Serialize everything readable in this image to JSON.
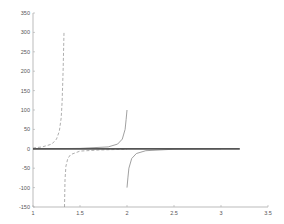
{
  "chart_data": {
    "type": "line",
    "title": "",
    "xlabel": "",
    "ylabel": "",
    "xlim": [
      1,
      3.5
    ],
    "ylim": [
      -150,
      350
    ],
    "grid": false,
    "legend": null,
    "x_ticks": [
      "1",
      "1.5",
      "2",
      "2.5",
      "3",
      "3.5"
    ],
    "y_ticks": [
      "350",
      "300",
      "250",
      "200",
      "150",
      "100",
      "50",
      "0",
      "-50",
      "-100",
      "-150"
    ],
    "series": [
      {
        "name": "dashed-curve",
        "style": "dashed",
        "color": "#999999",
        "segments": [
          {
            "x": [
              1.0,
              1.1,
              1.2,
              1.25,
              1.28,
              1.3,
              1.31,
              1.32,
              1.33
            ],
            "y": [
              2,
              5,
              12,
              25,
              45,
              80,
              120,
              200,
              300
            ]
          },
          {
            "x": [
              1.335,
              1.34,
              1.35,
              1.37,
              1.4,
              1.5,
              1.7,
              2.0
            ],
            "y": [
              -150,
              -80,
              -45,
              -25,
              -15,
              -6,
              -3,
              -1
            ]
          }
        ]
      },
      {
        "name": "solid-curve",
        "style": "solid",
        "color": "#888888",
        "segments": [
          {
            "x": [
              1.0,
              1.5,
              1.8,
              1.9,
              1.95,
              1.98,
              1.99,
              2.0
            ],
            "y": [
              0,
              1,
              5,
              12,
              25,
              50,
              75,
              100
            ]
          },
          {
            "x": [
              2.0,
              2.01,
              2.02,
              2.05,
              2.1,
              2.2,
              2.5,
              3.0
            ],
            "y": [
              -100,
              -75,
              -50,
              -25,
              -12,
              -5,
              -1,
              0
            ]
          }
        ]
      },
      {
        "name": "zero-line",
        "style": "solid-thick",
        "color": "#555555",
        "segments": [
          {
            "x": [
              1.0,
              3.2
            ],
            "y": [
              0,
              0
            ]
          }
        ]
      }
    ]
  }
}
